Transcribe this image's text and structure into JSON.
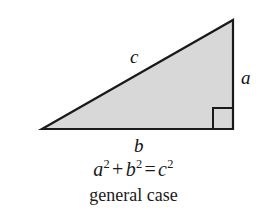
{
  "figure": {
    "background_color": "#ffffff",
    "stroke_color": "#1a1a1a",
    "fill_color": "#d8d8d8"
  },
  "triangle": {
    "vertices": {
      "bottom_left": [
        42,
        129
      ],
      "top_right": [
        233,
        20
      ],
      "bottom_right": [
        233,
        129
      ]
    },
    "right_angle_marker": {
      "corner": "bottom-right",
      "size": 20
    }
  },
  "labels": {
    "hypotenuse": "c",
    "vertical_leg": "a",
    "horizontal_leg": "b"
  },
  "equation": {
    "term_a": "a",
    "exp_a": "2",
    "plus": "+",
    "term_b": "b",
    "exp_b": "2",
    "equals": "=",
    "term_c": "c",
    "exp_c": "2"
  },
  "caption": {
    "text": "general case"
  }
}
